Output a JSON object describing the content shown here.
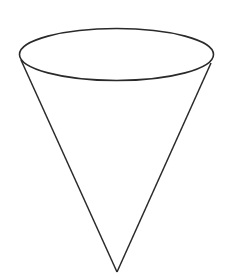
{
  "figure": {
    "stroke_color": "#2a2a2a",
    "background": "#ffffff",
    "rim": {
      "cx": 116.5,
      "cy": 54.5,
      "rx": 97,
      "ry": 26
    },
    "left_edge": {
      "x1": 21,
      "y1": 60,
      "x2": 117,
      "y2": 272
    },
    "right_edge": {
      "x1": 211,
      "y1": 63,
      "x2": 117,
      "y2": 272
    }
  }
}
